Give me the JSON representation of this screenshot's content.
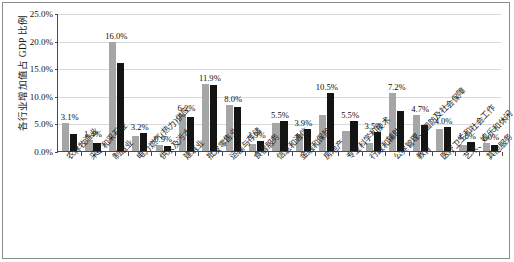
{
  "chart_data": {
    "type": "bar",
    "title": "",
    "subtitle": "",
    "xlabel": "",
    "ylabel": "各行业增加值占 GDP 比例",
    "ylim": [
      0,
      25
    ],
    "ytick_labels": [
      "0.0%",
      "5.0%",
      "10.0%",
      "15.0%",
      "20.0%",
      "25.0%"
    ],
    "ytick_values": [
      0,
      5,
      10,
      15,
      20,
      25
    ],
    "grid": true,
    "legend": "none",
    "categories": [
      "农林牧渔业",
      "采矿和采石业",
      "制造业",
      "电力燃气(热力)供应",
      "供水及污水",
      "建筑业",
      "批发零售业",
      "运输与存储",
      "食宿服务",
      "信息和通信",
      "金融和保险",
      "房地产",
      "专业科学和技术",
      "行政和辅助",
      "公共管理、国防及社会保障",
      "教育",
      "医疗卫生和社会工作",
      "艺术、娱乐和休闲",
      "其他服务"
    ],
    "series": [
      {
        "name": "series-1",
        "color": "#a6a6a6",
        "values": [
          5.1,
          2.0,
          19.8,
          2.7,
          1.0,
          6.7,
          12.1,
          8.4,
          1.3,
          5.0,
          3.1,
          6.6,
          3.6,
          1.4,
          10.5,
          6.5,
          4.0,
          1.0,
          1.4
        ]
      },
      {
        "name": "series-2",
        "color": "#141414",
        "values": [
          3.1,
          1.4,
          16.0,
          3.2,
          0.9,
          6.2,
          11.9,
          8.0,
          1.9,
          5.5,
          3.9,
          10.5,
          5.5,
          3.5,
          7.2,
          4.7,
          4.3,
          1.6,
          1.0
        ]
      }
    ],
    "data_labels": [
      {
        "text": "3.1%",
        "category_index": 0,
        "value": 3.1
      },
      {
        "text": "1.4%",
        "category_index": 1,
        "value": 1.4
      },
      {
        "text": "16.0%",
        "category_index": 2,
        "value": 16.0
      },
      {
        "text": "3.2%",
        "category_index": 3,
        "value": 3.2
      },
      {
        "text": "0.9%",
        "category_index": 4,
        "value": 0.9
      },
      {
        "text": "6.2%",
        "category_index": 5,
        "value": 6.2
      },
      {
        "text": "11.9%",
        "category_index": 6,
        "value": 11.9
      },
      {
        "text": "8.0%",
        "category_index": 7,
        "value": 8.0
      },
      {
        "text": "1.9%",
        "category_index": 8,
        "value": 1.9
      },
      {
        "text": "5.5%",
        "category_index": 9,
        "value": 5.5
      },
      {
        "text": "3.9%",
        "category_index": 10,
        "value": 3.9
      },
      {
        "text": "10.5%",
        "category_index": 11,
        "value": 10.5
      },
      {
        "text": "5.5%",
        "category_index": 12,
        "value": 5.5
      },
      {
        "text": "3.5%",
        "category_index": 13,
        "value": 3.5
      },
      {
        "text": "7.2%",
        "category_index": 14,
        "value": 7.2
      },
      {
        "text": "4.7%",
        "category_index": 15,
        "value": 4.7
      },
      {
        "text": "4.0%",
        "category_index": 16,
        "value": 4.0
      },
      {
        "text": "1.6%",
        "category_index": 17,
        "value": 1.6
      },
      {
        "text": "1.0%",
        "category_index": 18,
        "value": 1.0
      }
    ]
  },
  "colors": {
    "series_1": "#a6a6a6",
    "series_2": "#141414",
    "gridline": "#d9d9d9",
    "axis": "#4a4a4a",
    "frame": "#8a8a8a",
    "text": "#111111"
  }
}
